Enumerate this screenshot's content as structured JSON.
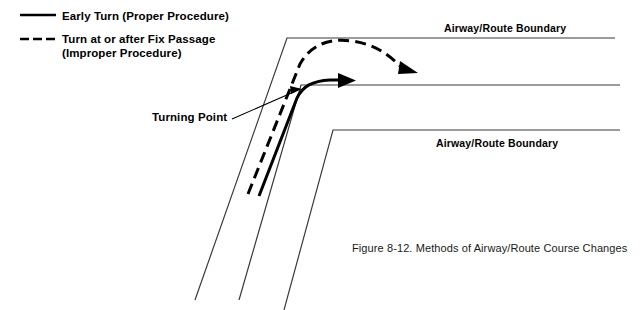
{
  "figure": {
    "caption": "Figure 8-12. Methods of Airway/Route Course Changes"
  },
  "legend": {
    "items": [
      {
        "style": "solid",
        "line_1": "Early Turn (Proper Procedure)",
        "line_2": ""
      },
      {
        "style": "dashed",
        "line_1": "Turn at or after Fix Passage",
        "line_2": "(Improper Procedure)"
      }
    ]
  },
  "diagram": {
    "boundary_label_top": "Airway/Route Boundary",
    "boundary_label_bottom": "Airway/Route Boundary",
    "turning_point_label": "Turning Point",
    "colors": {
      "ink": "#000000",
      "boundary": "#3a3a3a"
    }
  }
}
